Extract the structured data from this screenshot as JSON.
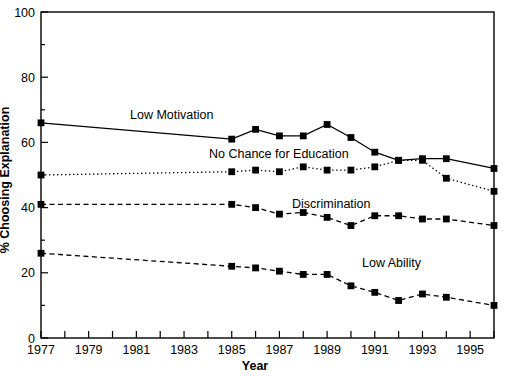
{
  "chart_data": {
    "type": "line",
    "title": "",
    "xlabel": "Year",
    "ylabel": "% Choosing Explanation",
    "xlim": [
      1977,
      1996
    ],
    "ylim": [
      0,
      100
    ],
    "yticks": [
      0,
      20,
      40,
      60,
      80,
      100
    ],
    "ytick_labels": [
      "0",
      "20",
      "40",
      "60",
      "80",
      "100"
    ],
    "xticks": [
      1977,
      1978,
      1979,
      1980,
      1981,
      1982,
      1983,
      1984,
      1985,
      1986,
      1987,
      1988,
      1989,
      1990,
      1991,
      1992,
      1993,
      1994,
      1995,
      1996
    ],
    "xtick_labels": [
      "1977",
      "",
      "1979",
      "",
      "1981",
      "",
      "1983",
      "",
      "1985",
      "",
      "1987",
      "",
      "1989",
      "",
      "1991",
      "",
      "1993",
      "",
      "1995",
      ""
    ],
    "grid": false,
    "legend_position": "inline-annotations",
    "series": [
      {
        "name": "Low Motivation",
        "label_text": "Low Motivation",
        "line_style": "solid",
        "marker": "square",
        "color": "#000000",
        "x": [
          1977,
          1985,
          1986,
          1987,
          1988,
          1989,
          1990,
          1991,
          1992,
          1993,
          1994,
          1996
        ],
        "values": [
          66,
          61,
          64,
          62,
          62,
          65.5,
          61.5,
          57,
          54.5,
          55,
          55,
          52
        ]
      },
      {
        "name": "No Chance for Education",
        "label_text": "No Chance for Education",
        "line_style": "dotted",
        "marker": "square",
        "color": "#000000",
        "x": [
          1977,
          1985,
          1986,
          1987,
          1988,
          1989,
          1990,
          1991,
          1992,
          1993,
          1994,
          1996
        ],
        "values": [
          50,
          51,
          51.5,
          51,
          52.5,
          51.5,
          51.5,
          52.5,
          54.5,
          54.5,
          49,
          45
        ]
      },
      {
        "name": "Discrimination",
        "label_text": "Discrimination",
        "line_style": "dashed",
        "marker": "square",
        "color": "#000000",
        "x": [
          1977,
          1985,
          1986,
          1987,
          1988,
          1989,
          1990,
          1991,
          1992,
          1993,
          1994,
          1996
        ],
        "values": [
          41,
          41,
          40,
          38,
          38.5,
          37,
          34.5,
          37.5,
          37.5,
          36.5,
          36.5,
          34.5
        ]
      },
      {
        "name": "Low Ability",
        "label_text": "Low Ability",
        "line_style": "dashed",
        "marker": "square",
        "color": "#000000",
        "x": [
          1977,
          1985,
          1986,
          1987,
          1988,
          1989,
          1990,
          1991,
          1992,
          1993,
          1994,
          1996
        ],
        "values": [
          26,
          22,
          21.5,
          20.5,
          19.5,
          19.5,
          16,
          14,
          11.5,
          13.5,
          12.5,
          10
        ]
      }
    ],
    "annotations": [
      {
        "text": "Low Motivation",
        "x_px": 130,
        "y_px": 119
      },
      {
        "text": "No Chance for Education",
        "x_px": 209,
        "y_px": 158
      },
      {
        "text": "Discrimination",
        "x_px": 292,
        "y_px": 208
      },
      {
        "text": "Low Ability",
        "x_px": 362,
        "y_px": 267
      }
    ]
  }
}
